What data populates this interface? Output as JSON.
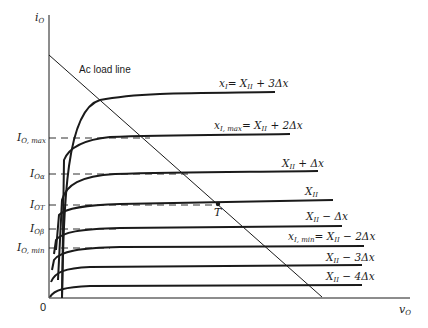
{
  "diagram": {
    "y_axis_label": "i_O",
    "x_axis_label": "v_O",
    "origin_label": "0",
    "load_line_label": "Ac load line",
    "operating_point_label": "T",
    "y_levels": [
      {
        "id": "io-max",
        "label_main": "I",
        "label_sub": "O, max"
      },
      {
        "id": "io-alpha",
        "label_main": "I",
        "label_sub": "Oα"
      },
      {
        "id": "io-t",
        "label_main": "I",
        "label_sub": "OT"
      },
      {
        "id": "io-beta",
        "label_main": "I",
        "label_sub": "Oβ"
      },
      {
        "id": "io-min",
        "label_main": "I",
        "label_sub": "O, min"
      }
    ],
    "curves": [
      {
        "id": "curve-plus3",
        "label": "x_I = X_II + 3Δx",
        "lhs": "x",
        "lhs_sub": "I",
        "rhs": "= X",
        "rhs_sub": "II",
        "tail": " + 3Δx"
      },
      {
        "id": "curve-plus2",
        "label": "x_I,max = X_II + 2Δx",
        "lhs": "x",
        "lhs_sub": "I, max",
        "rhs": "= X",
        "rhs_sub": "II",
        "tail": " + 2Δx"
      },
      {
        "id": "curve-plus1",
        "label": "X_II + Δx",
        "lhs": "X",
        "lhs_sub": "II",
        "tail": " + Δx"
      },
      {
        "id": "curve-zero",
        "label": "X_II",
        "lhs": "X",
        "lhs_sub": "II",
        "tail": ""
      },
      {
        "id": "curve-minus1",
        "label": "X_II − Δx",
        "lhs": "X",
        "lhs_sub": "II",
        "tail": " − Δx"
      },
      {
        "id": "curve-minus2",
        "label": "x_I,min = X_II − 2Δx",
        "lhs": "x",
        "lhs_sub": "I, min",
        "rhs": "= X",
        "rhs_sub": "II",
        "tail": " − 2Δx"
      },
      {
        "id": "curve-minus3",
        "label": "X_II − 3Δx",
        "lhs": "X",
        "lhs_sub": "II",
        "tail": " − 3Δx"
      },
      {
        "id": "curve-minus4",
        "label": "X_II − 4Δx",
        "lhs": "X",
        "lhs_sub": "II",
        "tail": " − 4Δx"
      }
    ],
    "colors": {
      "ink": "#1a1a1a",
      "background": "#ffffff"
    }
  }
}
